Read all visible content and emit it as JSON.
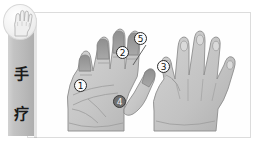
{
  "page": {
    "background_color": "#ffffff"
  },
  "sidebar": {
    "name": "hand-therapy-tab",
    "label_chars": [
      "手",
      "疗"
    ],
    "label": "手疗",
    "bar_color": "#c3c3c3",
    "badge": {
      "icon_name": "hand-icon",
      "background_color": "#f2f2f2"
    }
  },
  "panel": {
    "name": "hand-illustration-panel",
    "border_color": "#dcdcdc",
    "background_color": "#fefefe"
  },
  "diagram": {
    "type": "anatomical-illustration",
    "style": "grayscale line art with shading",
    "hands": [
      {
        "name": "left-hand-palm",
        "view": "palmar",
        "side": "left",
        "fill_color": "#c8c8c8",
        "outline_color": "#8a8a8a"
      },
      {
        "name": "right-hand-dorsal",
        "view": "dorsal",
        "side": "right",
        "fill_color": "#c8c8c8",
        "outline_color": "#8a8a8a"
      }
    ],
    "markers": [
      {
        "id": "marker-1",
        "label": "1",
        "x": 80,
        "y": 85,
        "hand": "left-hand-palm",
        "style": "light",
        "leader": false
      },
      {
        "id": "marker-2",
        "label": "2",
        "x": 122,
        "y": 52,
        "hand": "left-hand-palm",
        "style": "light",
        "leader": false
      },
      {
        "id": "marker-3",
        "label": "3",
        "x": 163,
        "y": 66,
        "hand": "right-hand-dorsal",
        "style": "light",
        "leader": false
      },
      {
        "id": "marker-4",
        "label": "4",
        "x": 119,
        "y": 101,
        "hand": "left-hand-palm",
        "style": "dark",
        "leader": false
      },
      {
        "id": "marker-5",
        "label": "5",
        "x": 140,
        "y": 38,
        "hand": "left-hand-palm",
        "style": "light",
        "leader": true
      }
    ],
    "marker_count": 5
  }
}
